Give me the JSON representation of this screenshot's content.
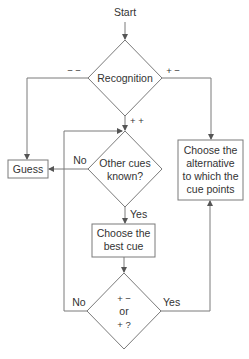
{
  "diagram": {
    "type": "flowchart",
    "colors": {
      "stroke": "#7a7a7a",
      "text": "#333333",
      "background": "#ffffff"
    },
    "start": {
      "label": "Start"
    },
    "nodes": {
      "recognition": {
        "shape": "diamond",
        "label": "Recognition"
      },
      "other_cues": {
        "shape": "diamond",
        "lines": [
          "Other cues",
          "known?"
        ]
      },
      "guess": {
        "shape": "box",
        "label": "Guess"
      },
      "choose_alternative": {
        "shape": "box",
        "lines": [
          "Choose the",
          "alternative",
          "to which the",
          "cue points"
        ]
      },
      "best_cue": {
        "shape": "box",
        "lines": [
          "Choose the",
          "best cue"
        ]
      },
      "cue_test": {
        "shape": "diamond",
        "lines": [
          "+ −",
          "or",
          "+ ?"
        ]
      }
    },
    "edges": {
      "recognition_minus_minus": "− −",
      "recognition_plus_minus": "+ −",
      "recognition_plus_plus": "+ +",
      "other_cues_no": "No",
      "other_cues_yes": "Yes",
      "cue_test_no": "No",
      "cue_test_yes": "Yes"
    }
  }
}
